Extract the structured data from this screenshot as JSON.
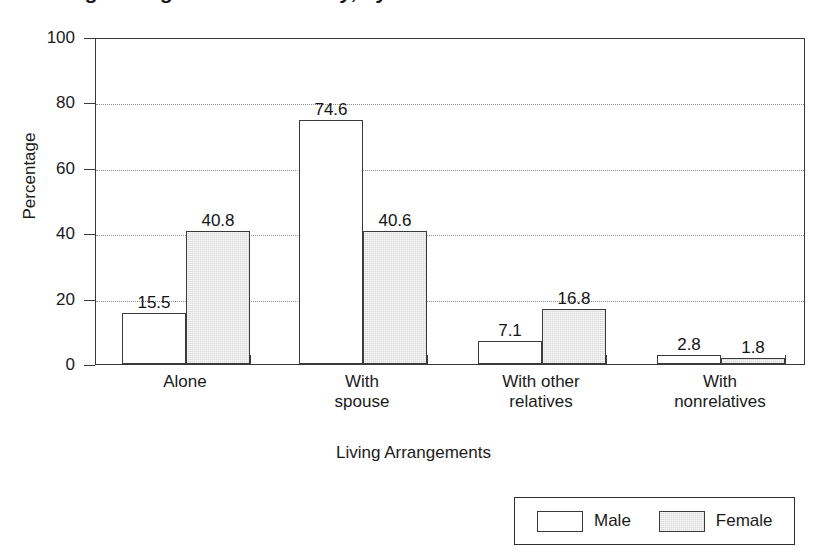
{
  "chart_data": {
    "type": "bar",
    "title": "",
    "title_cropped_fragment": "Living Arrangements of Elderly, by Sex",
    "xlabel": "Living Arrangements",
    "ylabel": "Percentage",
    "ylim": [
      0,
      100
    ],
    "yticks": [
      0,
      20,
      40,
      60,
      80,
      100
    ],
    "gridlines": [
      20,
      40,
      60,
      80
    ],
    "grid": true,
    "legend_position": "bottom-right",
    "categories": [
      "Alone",
      "With spouse",
      "With other relatives",
      "With nonrelatives"
    ],
    "category_lines": [
      [
        "Alone"
      ],
      [
        "With",
        "spouse"
      ],
      [
        "With other",
        "relatives"
      ],
      [
        "With",
        "nonrelatives"
      ]
    ],
    "series": [
      {
        "name": "Male",
        "color": "#ffffff",
        "values": [
          15.5,
          74.6,
          7.1,
          2.8
        ],
        "labels": [
          "15.5",
          "74.6",
          "7.1",
          "2.8"
        ]
      },
      {
        "name": "Female",
        "color": "#d9d9d9",
        "values": [
          40.8,
          40.6,
          16.8,
          1.8
        ],
        "labels": [
          "40.8",
          "40.6",
          "16.8",
          "1.8"
        ]
      }
    ]
  },
  "axis": {
    "y_tick_labels": [
      "100",
      "80",
      "60",
      "40",
      "20",
      "0"
    ],
    "y_title": "Percentage",
    "x_title": "Living Arrangements"
  },
  "legend": {
    "items": [
      {
        "label": "Male",
        "fill": "#ffffff"
      },
      {
        "label": "Female",
        "fill": "#d9d9d9"
      }
    ]
  },
  "colors": {
    "axis": "#3a3a3a",
    "grid": "#8e8e8e",
    "male_fill": "#ffffff",
    "female_fill": "#d9d9d9",
    "text": "#1a1a1a",
    "background": "#ffffff"
  }
}
